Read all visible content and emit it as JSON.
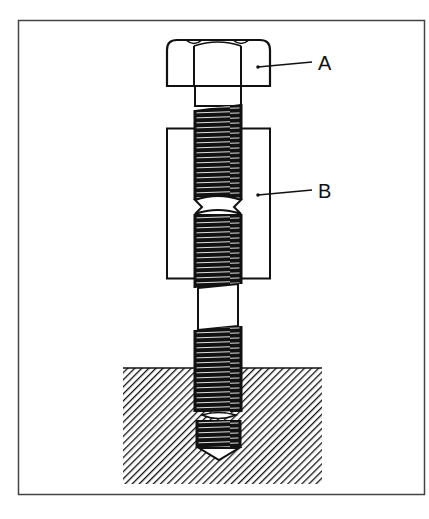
{
  "diagram": {
    "type": "technical-illustration",
    "labels": [
      {
        "id": "A",
        "text": "A",
        "points_to": "bolt hex head"
      },
      {
        "id": "B",
        "text": "B",
        "points_to": "sleeve / spacer"
      }
    ],
    "colors": {
      "line": "#111111",
      "background": "#ffffff",
      "frame": "#444444"
    }
  }
}
